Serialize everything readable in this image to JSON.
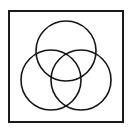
{
  "figure": {
    "background_color": "#ffffff",
    "stroke_color": "#151515",
    "frame": {
      "label": "figure-border",
      "x": 8,
      "y": 10,
      "width": 116,
      "height": 113,
      "border_width": 2,
      "border_color": "#1b1b1b",
      "fill": "#ffffff"
    }
  },
  "chart_data": {
    "type": "scatter",
    "subtitle": "",
    "xlabel": "",
    "ylabel": "",
    "grid": false,
    "legend": "none",
    "xlim": [
      0,
      132
    ],
    "ylim": [
      0,
      131
    ],
    "annotations": [],
    "shapes": [
      {
        "name": "top-circle",
        "kind": "circle",
        "cx": 66,
        "cy": 51,
        "r": 30,
        "fill": "none",
        "stroke": "#151515",
        "stroke_width": 1.6
      },
      {
        "name": "left-circle",
        "kind": "circle",
        "cx": 51,
        "cy": 80,
        "r": 30,
        "fill": "none",
        "stroke": "#151515",
        "stroke_width": 1.6
      },
      {
        "name": "right-circle",
        "kind": "circle",
        "cx": 81,
        "cy": 80,
        "r": 30,
        "fill": "none",
        "stroke": "#151515",
        "stroke_width": 1.6
      }
    ]
  }
}
